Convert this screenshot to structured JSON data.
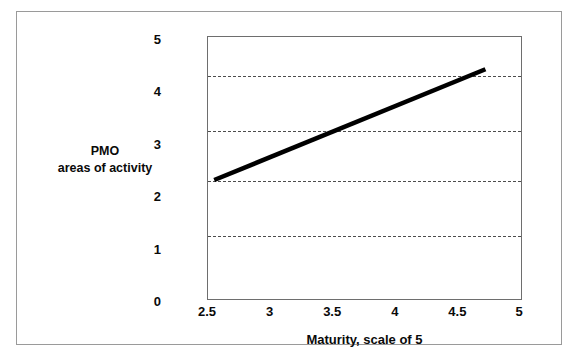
{
  "figure": {
    "background_color": "#ffffff",
    "frame_color": "#9a9a9a",
    "plot_border_color": "#6e6e6e"
  },
  "chart_data": {
    "type": "line",
    "title": "",
    "xlabel": "Maturity, scale of 5",
    "ylabel_line1": "PMO",
    "ylabel_line2": "areas of activity",
    "xlim": [
      2.5,
      5
    ],
    "ylim": [
      0,
      5
    ],
    "xticks": [
      2.5,
      3,
      3.5,
      4,
      4.5,
      5
    ],
    "xtick_labels": [
      "2.5",
      "3",
      "3.5",
      "4",
      "4.5",
      "5"
    ],
    "yticks": [
      0,
      1,
      2,
      3,
      4,
      5
    ],
    "ytick_labels": [
      "5",
      "4",
      "3",
      "2",
      "1",
      "0"
    ],
    "grid": "horizontal-dashed",
    "gridlines_y": [
      1.2,
      2.25,
      3.2,
      4.25
    ],
    "legend": "none",
    "series": [
      {
        "name": "PMO areas of activity vs Maturity",
        "color": "#000000",
        "line_width": 4,
        "x": [
          2.55,
          4.73
        ],
        "y": [
          2.25,
          4.38
        ]
      }
    ]
  },
  "ytick_positions_px": [
    27,
    82,
    136,
    190,
    243,
    272
  ],
  "gridline_positions_px": [
    70,
    127,
    179,
    234
  ],
  "xtick_positions_px": [
    11,
    72,
    133,
    195,
    256,
    314
  ]
}
